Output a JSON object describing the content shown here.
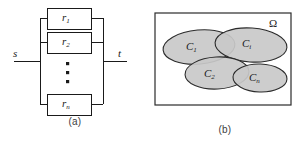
{
  "figure": {
    "panels": [
      {
        "id": "a",
        "caption": "(a)",
        "type": "parallel-block-diagram",
        "terminals": [
          {
            "name": "source-terminal",
            "label": "s"
          },
          {
            "name": "sink-terminal",
            "label": "t"
          }
        ],
        "blocks": [
          {
            "name": "block-r1",
            "base": "r",
            "sub": "1"
          },
          {
            "name": "block-r2",
            "base": "r",
            "sub": "2"
          },
          {
            "name": "block-rn",
            "base": "r",
            "sub": "n"
          }
        ],
        "ellipsis": "vertical-dots"
      },
      {
        "id": "b",
        "caption": "(b)",
        "type": "venn-diagram",
        "universe_label": "Ω",
        "sets": [
          {
            "name": "set-c1",
            "base": "C",
            "sub": "1"
          },
          {
            "name": "set-ci",
            "base": "C",
            "sub": "i"
          },
          {
            "name": "set-c2",
            "base": "C",
            "sub": "2"
          },
          {
            "name": "set-cn",
            "base": "C",
            "sub": "n"
          }
        ]
      }
    ]
  },
  "colors": {
    "line": "#1a1a1a",
    "ellipse_fill": "#c9c9c9",
    "ellipse_stroke": "#2b2b2b",
    "frame_stroke": "#2b2b2b",
    "caption_text": "#404040",
    "background": "#ffffff"
  }
}
